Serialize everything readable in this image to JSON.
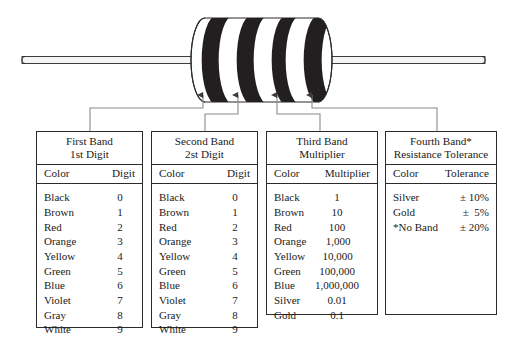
{
  "figure": {
    "name": "resistor-with-four-color-bands",
    "body_fill": "#ffffff",
    "band_fill": "#231f20",
    "outline_color": "#2b2b2b",
    "lead_fill": "#f2f2f2",
    "band_count": 4,
    "arrow_count": 4
  },
  "tables": [
    {
      "id": "first-band",
      "title_line1": "First Band",
      "title_line2": "1st Digit",
      "col_color": "Color",
      "col_value": "Digit",
      "rows": [
        {
          "color": "Black",
          "value": "0"
        },
        {
          "color": "Brown",
          "value": "1"
        },
        {
          "color": "Red",
          "value": "2"
        },
        {
          "color": "Orange",
          "value": "3"
        },
        {
          "color": "Yellow",
          "value": "4"
        },
        {
          "color": "Green",
          "value": "5"
        },
        {
          "color": "Blue",
          "value": "6"
        },
        {
          "color": "Violet",
          "value": "7"
        },
        {
          "color": "Gray",
          "value": "8"
        },
        {
          "color": "White",
          "value": "9"
        }
      ]
    },
    {
      "id": "second-band",
      "title_line1": "Second Band",
      "title_line2": "2st Digit",
      "col_color": "Color",
      "col_value": "Digit",
      "rows": [
        {
          "color": "Black",
          "value": "0"
        },
        {
          "color": "Brown",
          "value": "1"
        },
        {
          "color": "Red",
          "value": "2"
        },
        {
          "color": "Orange",
          "value": "3"
        },
        {
          "color": "Yellow",
          "value": "4"
        },
        {
          "color": "Green",
          "value": "5"
        },
        {
          "color": "Blue",
          "value": "6"
        },
        {
          "color": "Violet",
          "value": "7"
        },
        {
          "color": "Gray",
          "value": "8"
        },
        {
          "color": "White",
          "value": "9"
        }
      ]
    },
    {
      "id": "third-band",
      "title_line1": "Third Band",
      "title_line2": "Multiplier",
      "col_color": "Color",
      "col_value": "Multiplier",
      "rows": [
        {
          "color": "Black",
          "value": "1"
        },
        {
          "color": "Brown",
          "value": "10"
        },
        {
          "color": "Red",
          "value": "100"
        },
        {
          "color": "Orange",
          "value": "1,000"
        },
        {
          "color": "Yellow",
          "value": "10,000"
        },
        {
          "color": "Green",
          "value": "100,000"
        },
        {
          "color": "Blue",
          "value": "1,000,000"
        },
        {
          "color": "Silver",
          "value": "0.01"
        },
        {
          "color": "Gold",
          "value": "0.1"
        }
      ]
    },
    {
      "id": "fourth-band",
      "title_line1": "Fourth Band*",
      "title_line2": "Resistance Tolerance",
      "col_color": "Color",
      "col_value": "Tolerance",
      "rows": [
        {
          "color": "Silver",
          "value": "± 10%"
        },
        {
          "color": "Gold",
          "value": "±  5%"
        },
        {
          "color": "*No Band",
          "value": "± 20%"
        }
      ]
    }
  ]
}
